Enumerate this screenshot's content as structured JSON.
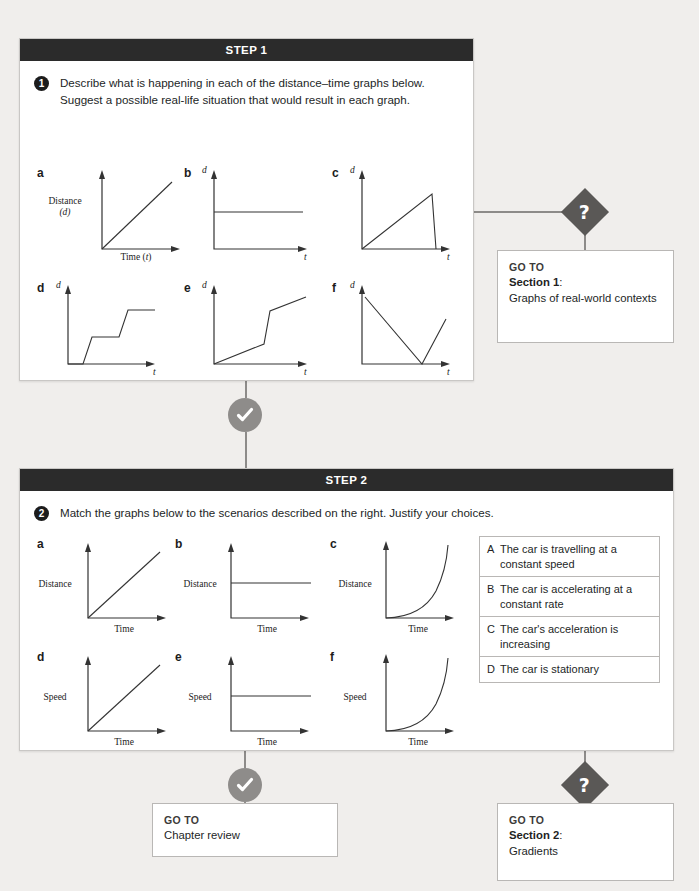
{
  "step1": {
    "header": "STEP 1",
    "question_number": "1",
    "question_text": "Describe what is happening in each of the distance–time graphs below. Suggest a possible real-life situation that would result in each graph.",
    "graphs": [
      {
        "label": "a",
        "ylabel": "Distance",
        "ysub": "(d)",
        "xlabel": "Time (t)",
        "shape": "linear-increase"
      },
      {
        "label": "b",
        "ylabel": "d",
        "xlabel": "t",
        "shape": "constant-horizontal"
      },
      {
        "label": "c",
        "ylabel": "d",
        "xlabel": "t",
        "shape": "rise-then-sharp-drop"
      },
      {
        "label": "d",
        "ylabel": "d",
        "xlabel": "t",
        "shape": "staircase"
      },
      {
        "label": "e",
        "ylabel": "d",
        "xlabel": "t",
        "shape": "shallow-steep-shallow"
      },
      {
        "label": "f",
        "ylabel": "d",
        "xlabel": "t",
        "shape": "decline-then-rise"
      }
    ]
  },
  "step2": {
    "header": "STEP 2",
    "question_number": "2",
    "question_text": "Match the graphs below to the scenarios described on the right. Justify your choices.",
    "graphs": [
      {
        "label": "a",
        "ylabel": "Distance",
        "xlabel": "Time",
        "shape": "linear-increase"
      },
      {
        "label": "b",
        "ylabel": "Distance",
        "xlabel": "Time",
        "shape": "constant-horizontal"
      },
      {
        "label": "c",
        "ylabel": "Distance",
        "xlabel": "Time",
        "shape": "exponential-curve"
      },
      {
        "label": "d",
        "ylabel": "Speed",
        "xlabel": "Time",
        "shape": "linear-increase"
      },
      {
        "label": "e",
        "ylabel": "Speed",
        "xlabel": "Time",
        "shape": "constant-horizontal"
      },
      {
        "label": "f",
        "ylabel": "Speed",
        "xlabel": "Time",
        "shape": "exponential-curve"
      }
    ]
  },
  "scenarios": [
    {
      "key": "A",
      "text": "The car is travelling at a constant speed"
    },
    {
      "key": "B",
      "text": "The car is accelerating at a constant rate"
    },
    {
      "key": "C",
      "text": "The car's acceleration is increasing"
    },
    {
      "key": "D",
      "text": "The car is stationary"
    }
  ],
  "goto_boxes": {
    "section1": {
      "heading": "GO TO",
      "target": "Section 1",
      "colon": ":",
      "detail": "Graphs of real-world contexts"
    },
    "chapter_review": {
      "heading": "GO TO",
      "detail": "Chapter review"
    },
    "section2": {
      "heading": "GO TO",
      "target": "Section 2",
      "colon": ":",
      "detail": "Gradients"
    }
  },
  "nodes": {
    "question_symbol": "?",
    "check_symbol": "check-mark"
  },
  "colors": {
    "header_bar": "#2b2b2b",
    "page_background": "#f0eeec",
    "question_diamond": "#5a5856",
    "check_circle": "#8e8c8a",
    "connector": "#8d8b89"
  }
}
